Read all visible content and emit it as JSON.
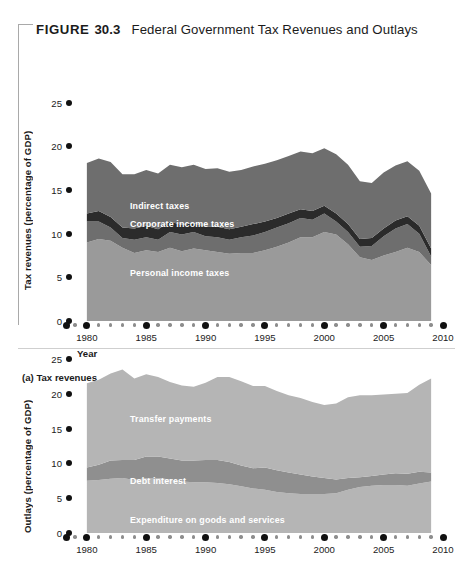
{
  "figure": {
    "label": "FIGURE",
    "number": "30.3",
    "title": "Federal Government Tax Revenues and Outlays"
  },
  "panels": [
    {
      "caption": "(a) Tax revenues",
      "ylabel": "Tax revenues (percentage of GDP)",
      "xlabel": "Year",
      "series_labels": [
        "Social Security taxes",
        "Indirect taxes",
        "Corporate income taxes",
        "Personal income taxes"
      ]
    },
    {
      "caption": "",
      "ylabel": "Outlays (percentage of GDP)",
      "xlabel": "",
      "series_labels": [
        "Transfer payments",
        "Debt interest",
        "Expenditure on goods and services"
      ]
    }
  ],
  "colors": {
    "band_light": "#b5b5b5",
    "band_mid": "#9a9a9a",
    "band_dark": "#6e6e6e",
    "band_darkest": "#2b2b2b",
    "axis_dot": "#111111",
    "minor_dot": "#8d8d8d",
    "text": "#1b1b1b",
    "label_text": "#ffffff",
    "bracket": "#a9a9a9"
  },
  "chart_data": [
    {
      "type": "area",
      "title": "(a) Tax revenues",
      "xlabel": "Year",
      "ylabel": "Tax revenues (percentage of GDP)",
      "xlim": [
        1979,
        2010
      ],
      "ylim": [
        0,
        26
      ],
      "yticks": [
        0,
        5,
        10,
        15,
        20,
        25
      ],
      "xticks": [
        1980,
        1985,
        1990,
        1995,
        2000,
        2005,
        2010
      ],
      "grid": false,
      "legend": "in-plot labels",
      "stacked": true,
      "x": [
        1980,
        1981,
        1982,
        1983,
        1984,
        1985,
        1986,
        1987,
        1988,
        1989,
        1990,
        1991,
        1992,
        1993,
        1994,
        1995,
        1996,
        1997,
        1998,
        1999,
        2000,
        2001,
        2002,
        2003,
        2004,
        2005,
        2006,
        2007,
        2008,
        2009
      ],
      "series": [
        {
          "name": "Personal income taxes",
          "values": [
            9.0,
            9.4,
            9.2,
            8.4,
            7.8,
            8.1,
            7.9,
            8.4,
            8.0,
            8.3,
            8.1,
            7.9,
            7.7,
            7.8,
            7.8,
            8.1,
            8.5,
            9.0,
            9.6,
            9.6,
            10.2,
            9.9,
            8.8,
            7.3,
            7.0,
            7.5,
            7.9,
            8.4,
            7.9,
            6.4
          ],
          "color": "#9a9a9a"
        },
        {
          "name": "Corporate income taxes",
          "values": [
            2.4,
            2.0,
            1.5,
            1.1,
            1.5,
            1.5,
            1.4,
            1.8,
            1.9,
            1.9,
            1.6,
            1.7,
            1.6,
            1.8,
            2.0,
            2.1,
            2.2,
            2.2,
            2.2,
            2.0,
            2.1,
            1.5,
            1.4,
            1.2,
            1.6,
            2.2,
            2.7,
            2.7,
            2.1,
            1.0
          ],
          "color": "#6e6e6e"
        },
        {
          "name": "Indirect taxes",
          "values": [
            0.9,
            1.2,
            1.2,
            1.2,
            1.3,
            1.3,
            1.2,
            1.2,
            1.1,
            1.0,
            1.1,
            1.2,
            1.2,
            1.2,
            1.3,
            1.2,
            1.1,
            1.1,
            1.0,
            1.0,
            0.9,
            0.9,
            0.9,
            0.9,
            0.9,
            0.9,
            0.9,
            0.9,
            0.9,
            0.9
          ],
          "color": "#2b2b2b"
        },
        {
          "name": "Social Security taxes",
          "values": [
            5.8,
            6.0,
            6.3,
            6.1,
            6.2,
            6.4,
            6.4,
            6.5,
            6.6,
            6.7,
            6.6,
            6.7,
            6.6,
            6.5,
            6.6,
            6.6,
            6.6,
            6.6,
            6.6,
            6.6,
            6.6,
            6.8,
            6.8,
            6.6,
            6.3,
            6.4,
            6.3,
            6.3,
            6.3,
            6.3
          ],
          "color": "#6e6e6e"
        }
      ],
      "totals": [
        18.1,
        18.6,
        18.2,
        16.8,
        16.8,
        17.3,
        16.9,
        17.9,
        17.6,
        17.9,
        17.4,
        17.5,
        17.1,
        17.3,
        17.7,
        18.0,
        18.4,
        18.9,
        19.4,
        19.2,
        19.8,
        19.1,
        17.9,
        16.0,
        15.8,
        17.0,
        17.8,
        18.3,
        17.2,
        14.6
      ]
    },
    {
      "type": "area",
      "title": "(b) Outlays",
      "xlabel": "Year",
      "ylabel": "Outlays (percentage of GDP)",
      "xlim": [
        1979,
        2010
      ],
      "ylim": [
        0,
        26
      ],
      "yticks": [
        0,
        5,
        10,
        15,
        20,
        25
      ],
      "xticks": [
        1980,
        1985,
        1990,
        1995,
        2000,
        2005,
        2010
      ],
      "grid": false,
      "legend": "in-plot labels",
      "stacked": true,
      "x": [
        1980,
        1981,
        1982,
        1983,
        1984,
        1985,
        1986,
        1987,
        1988,
        1989,
        1990,
        1991,
        1992,
        1993,
        1994,
        1995,
        1996,
        1997,
        1998,
        1999,
        2000,
        2001,
        2002,
        2003,
        2004,
        2005,
        2006,
        2007,
        2008,
        2009
      ],
      "series": [
        {
          "name": "Expenditure on goods and services",
          "values": [
            7.5,
            7.6,
            7.8,
            7.9,
            7.6,
            7.9,
            7.9,
            7.7,
            7.4,
            7.3,
            7.3,
            7.2,
            7.0,
            6.7,
            6.4,
            6.2,
            5.9,
            5.7,
            5.6,
            5.6,
            5.6,
            5.7,
            6.2,
            6.6,
            6.8,
            6.9,
            6.9,
            6.8,
            7.1,
            7.4
          ],
          "color": "#b5b5b5"
        },
        {
          "name": "Debt interest",
          "values": [
            1.9,
            2.2,
            2.6,
            2.6,
            2.9,
            3.1,
            3.1,
            3.0,
            3.0,
            3.1,
            3.2,
            3.3,
            3.2,
            3.0,
            2.9,
            3.2,
            3.1,
            3.0,
            2.8,
            2.5,
            2.3,
            2.0,
            1.7,
            1.4,
            1.4,
            1.5,
            1.7,
            1.7,
            1.7,
            1.3
          ],
          "color": "#8f8f8f"
        },
        {
          "name": "Transfer payments",
          "values": [
            12.1,
            12.2,
            12.5,
            13.0,
            11.7,
            11.8,
            11.4,
            11.0,
            10.8,
            10.6,
            11.1,
            11.9,
            12.2,
            12.1,
            11.8,
            11.7,
            11.4,
            11.1,
            11.0,
            10.7,
            10.5,
            10.9,
            11.6,
            11.8,
            11.6,
            11.5,
            11.4,
            11.6,
            12.5,
            13.5
          ],
          "color": "#b5b5b5"
        }
      ],
      "totals": [
        21.5,
        22.0,
        22.9,
        23.5,
        22.2,
        22.8,
        22.4,
        21.7,
        21.2,
        21.0,
        21.6,
        22.4,
        22.4,
        21.8,
        21.1,
        21.1,
        20.4,
        19.8,
        19.4,
        18.8,
        18.4,
        18.6,
        19.5,
        19.8,
        19.8,
        19.9,
        20.0,
        20.1,
        21.3,
        22.2
      ]
    }
  ]
}
